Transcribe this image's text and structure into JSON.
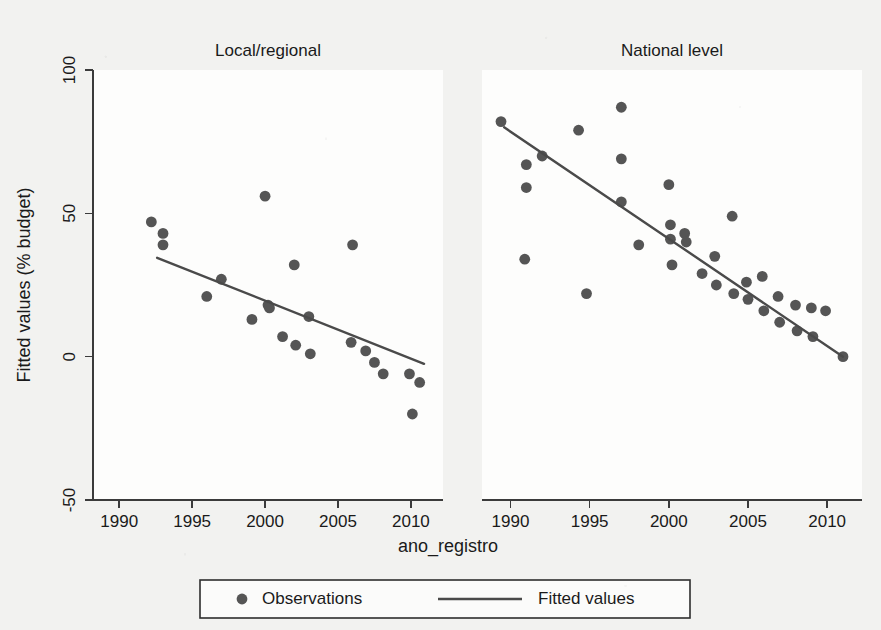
{
  "chart_data": {
    "type": "scatter",
    "title": "",
    "xlabel": "ano_registro",
    "ylabel": "Fitted values (% budget)",
    "xlim": [
      1988.2,
      2012.2
    ],
    "ylim": [
      -50,
      100
    ],
    "xticks": [
      1990,
      1995,
      2000,
      2005,
      2010
    ],
    "xtick_labels": [
      "1990",
      "1995",
      "2000",
      "2005",
      "2010"
    ],
    "yticks": [
      -50,
      0,
      50,
      100
    ],
    "ytick_labels": [
      "-50",
      "0",
      "50",
      "100"
    ],
    "grid": false,
    "legend_position": "bottom",
    "marker_color": "#555555",
    "line_color": "#4a4a4a",
    "legend": [
      {
        "label": "Observations",
        "marker": "circle"
      },
      {
        "label": "Fitted values",
        "marker": "line"
      }
    ],
    "panels": [
      {
        "name": "local-regional",
        "title": "Local/regional",
        "series": [
          {
            "name": "Observations",
            "type": "scatter",
            "points": [
              {
                "x": 1992.2,
                "y": 47
              },
              {
                "x": 1993.0,
                "y": 43
              },
              {
                "x": 1993.0,
                "y": 39
              },
              {
                "x": 1996.0,
                "y": 21
              },
              {
                "x": 1997.0,
                "y": 27
              },
              {
                "x": 1999.1,
                "y": 13
              },
              {
                "x": 2000.0,
                "y": 56
              },
              {
                "x": 2000.2,
                "y": 18
              },
              {
                "x": 2000.3,
                "y": 17
              },
              {
                "x": 2001.2,
                "y": 7
              },
              {
                "x": 2002.0,
                "y": 32
              },
              {
                "x": 2002.1,
                "y": 4
              },
              {
                "x": 2003.0,
                "y": 14
              },
              {
                "x": 2003.1,
                "y": 1
              },
              {
                "x": 2006.0,
                "y": 39
              },
              {
                "x": 2005.9,
                "y": 5
              },
              {
                "x": 2006.9,
                "y": 2
              },
              {
                "x": 2007.5,
                "y": -2
              },
              {
                "x": 2008.1,
                "y": -6
              },
              {
                "x": 2009.9,
                "y": -6
              },
              {
                "x": 2010.6,
                "y": -9
              },
              {
                "x": 2010.1,
                "y": -20
              }
            ]
          },
          {
            "name": "Fitted values",
            "type": "line",
            "points": [
              {
                "x": 1992.6,
                "y": 34.5
              },
              {
                "x": 2010.9,
                "y": -2.5
              }
            ]
          }
        ]
      },
      {
        "name": "national-level",
        "title": "National level",
        "series": [
          {
            "name": "Observations",
            "type": "scatter",
            "points": [
              {
                "x": 1989.4,
                "y": 82
              },
              {
                "x": 1991.0,
                "y": 67
              },
              {
                "x": 1991.0,
                "y": 59
              },
              {
                "x": 1990.9,
                "y": 34
              },
              {
                "x": 1992.0,
                "y": 70
              },
              {
                "x": 1994.3,
                "y": 79
              },
              {
                "x": 1994.8,
                "y": 22
              },
              {
                "x": 1997.0,
                "y": 87
              },
              {
                "x": 1997.0,
                "y": 69
              },
              {
                "x": 1997.0,
                "y": 54
              },
              {
                "x": 1998.1,
                "y": 39
              },
              {
                "x": 2000.0,
                "y": 60
              },
              {
                "x": 2000.1,
                "y": 46
              },
              {
                "x": 2000.1,
                "y": 41
              },
              {
                "x": 2000.2,
                "y": 32
              },
              {
                "x": 2001.0,
                "y": 43
              },
              {
                "x": 2001.1,
                "y": 40
              },
              {
                "x": 2002.1,
                "y": 29
              },
              {
                "x": 2002.9,
                "y": 35
              },
              {
                "x": 2003.0,
                "y": 25
              },
              {
                "x": 2004.0,
                "y": 49
              },
              {
                "x": 2004.1,
                "y": 22
              },
              {
                "x": 2004.9,
                "y": 26
              },
              {
                "x": 2005.0,
                "y": 20
              },
              {
                "x": 2005.9,
                "y": 28
              },
              {
                "x": 2006.0,
                "y": 16
              },
              {
                "x": 2006.9,
                "y": 21
              },
              {
                "x": 2007.0,
                "y": 12
              },
              {
                "x": 2008.0,
                "y": 18
              },
              {
                "x": 2008.1,
                "y": 9
              },
              {
                "x": 2009.0,
                "y": 17
              },
              {
                "x": 2009.1,
                "y": 7
              },
              {
                "x": 2009.9,
                "y": 16
              },
              {
                "x": 2011.0,
                "y": 0
              }
            ]
          },
          {
            "name": "Fitted values",
            "type": "line",
            "points": [
              {
                "x": 1989.6,
                "y": 80
              },
              {
                "x": 2011.0,
                "y": 0
              }
            ]
          }
        ]
      }
    ]
  },
  "figure": {
    "x_axis_title": "ano_registro",
    "y_axis_title": "Fitted values (% budget)"
  }
}
